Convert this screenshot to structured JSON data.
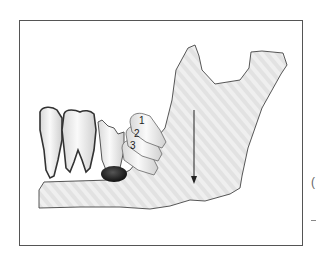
{
  "figure": {
    "type": "anatomical-diagram",
    "labels": [
      {
        "id": "1",
        "text": "1"
      },
      {
        "id": "2",
        "text": "2"
      },
      {
        "id": "3",
        "text": "3"
      }
    ],
    "arrow": {
      "direction": "down"
    },
    "edge_glyph": "(",
    "colors": {
      "frame_border": "#555555",
      "bone_fill": "#ececec",
      "bone_stroke": "#444444",
      "tooth_fill": "#f4f4f4",
      "root_outline": "#3a3a3a",
      "dark_mass": "#1e1e1e",
      "arrow": "#222222",
      "background": "#ffffff"
    }
  }
}
